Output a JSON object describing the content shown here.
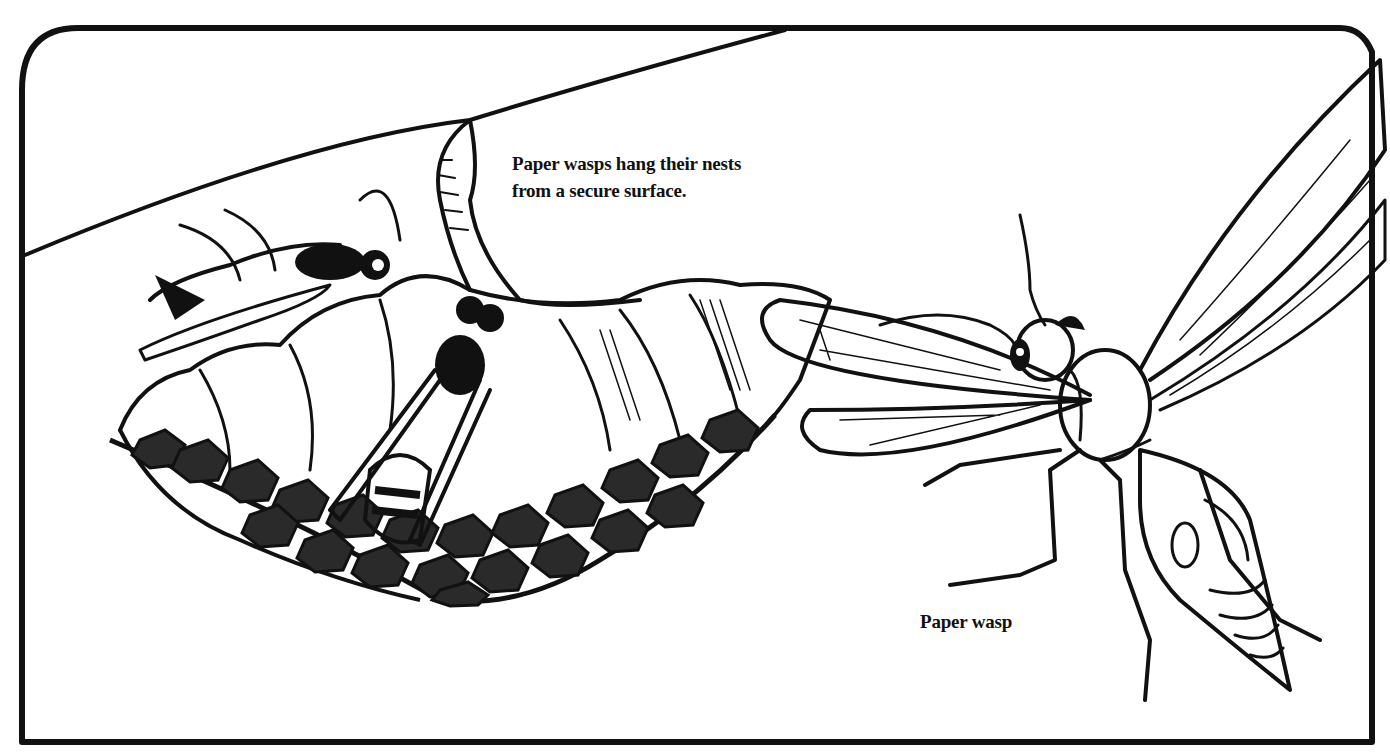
{
  "illustration": {
    "subject": "Paper wasps and nest",
    "colors": {
      "ink": "#111111",
      "paper": "#ffffff"
    }
  },
  "captions": {
    "nest_line1": "Paper wasps hang their nests",
    "nest_line2": "from a secure surface.",
    "wasp_label": "Paper wasp"
  }
}
